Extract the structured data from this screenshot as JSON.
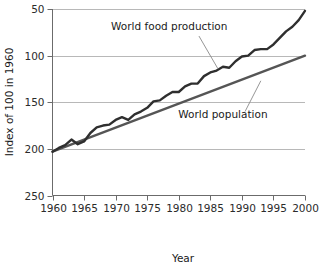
{
  "chart_data": {
    "type": "line",
    "title": "",
    "xlabel": "Year",
    "ylabel": "Index of 100 in 1960",
    "xlim": [
      1960,
      2000
    ],
    "ylim": [
      50,
      250
    ],
    "xticks": [
      1960,
      1965,
      1970,
      1975,
      1980,
      1985,
      1990,
      1995,
      2000
    ],
    "yticks": [
      50,
      100,
      150,
      200,
      250
    ],
    "grid": "horizontal",
    "legend_position": "inline-annotations",
    "series": [
      {
        "name": "World food production",
        "color": "#2f2f2f",
        "label_x": 1978.5,
        "label_y": 228,
        "leader_from": [
          1983.2,
          221
        ],
        "leader_to": [
          1986.2,
          186
        ],
        "x": [
          1960,
          1961,
          1962,
          1963,
          1964,
          1965,
          1966,
          1967,
          1968,
          1969,
          1970,
          1971,
          1972,
          1973,
          1974,
          1975,
          1976,
          1977,
          1978,
          1979,
          1980,
          1981,
          1982,
          1983,
          1984,
          1985,
          1986,
          1987,
          1988,
          1989,
          1990,
          1991,
          1992,
          1993,
          1994,
          1995,
          1996,
          1997,
          1998,
          1999,
          2000
        ],
        "values": [
          97,
          101,
          104,
          110,
          105,
          108,
          117,
          123,
          125,
          126,
          131,
          134,
          131,
          137,
          140,
          144,
          151,
          152,
          157,
          161,
          161,
          167,
          170,
          170,
          178,
          182,
          184,
          188,
          187,
          194,
          199,
          200,
          206,
          207,
          207,
          212,
          219,
          226,
          231,
          238,
          248
        ]
      },
      {
        "name": "World population",
        "color": "#555555",
        "label_x": 1987,
        "label_y": 133,
        "leader_from": [
          1990.5,
          140
        ],
        "leader_to": [
          1993.0,
          173
        ],
        "x": [
          1960,
          2000
        ],
        "values": [
          97,
          200
        ]
      }
    ]
  },
  "axis": {
    "y_tick_labels": [
      "250",
      "200",
      "150",
      "100",
      "50"
    ],
    "x_tick_labels": [
      "1960",
      "1965",
      "1970",
      "1975",
      "1980",
      "1985",
      "1990",
      "1995",
      "2000"
    ],
    "x_title": "Year",
    "y_title": "Index of 100 in 1960"
  },
  "annotations": {
    "food_label": "World food production",
    "population_label": "World population"
  },
  "colors": {
    "food_line": "#2f2f2f",
    "population_line": "#555555",
    "gridline": "#b8b8b8",
    "axis": "#6b6b6b",
    "text": "#1a1a1a",
    "background": "#ffffff"
  }
}
